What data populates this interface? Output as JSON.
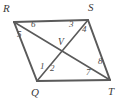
{
  "figure": {
    "type": "geometry-diagram",
    "shape": "parallelogram",
    "background_color": "#ffffff",
    "stroke_color": "#5a5a5a",
    "label_color": "#3a3a3a",
    "width": 123,
    "height": 105
  },
  "vertices": [
    {
      "id": "R",
      "label": "R",
      "x": 14,
      "y": 22,
      "label_x": 3,
      "label_y": 3
    },
    {
      "id": "S",
      "label": "S",
      "x": 88,
      "y": 20,
      "label_x": 88,
      "label_y": 2
    },
    {
      "id": "T",
      "label": "T",
      "x": 110,
      "y": 80,
      "label_x": 108,
      "label_y": 86
    },
    {
      "id": "Q",
      "label": "Q",
      "x": 37,
      "y": 81,
      "label_x": 31,
      "label_y": 87
    },
    {
      "id": "V",
      "label": "V",
      "x": 64,
      "y": 50,
      "label_x": 58,
      "label_y": 38
    }
  ],
  "edges": [
    {
      "name": "RS",
      "from": "R",
      "to": "S"
    },
    {
      "name": "ST",
      "from": "S",
      "to": "T"
    },
    {
      "name": "TQ",
      "from": "T",
      "to": "Q"
    },
    {
      "name": "QR",
      "from": "Q",
      "to": "R"
    }
  ],
  "diagonals": [
    {
      "name": "RT",
      "from": "R",
      "to": "T"
    },
    {
      "name": "QS",
      "from": "Q",
      "to": "S"
    }
  ],
  "angles": [
    {
      "number": "1",
      "at_vertex": "Q",
      "x": 40,
      "y": 62
    },
    {
      "number": "2",
      "at_vertex": "Q",
      "x": 50,
      "y": 64
    },
    {
      "number": "3",
      "at_vertex": "S",
      "x": 69,
      "y": 20
    },
    {
      "number": "4",
      "at_vertex": "S",
      "x": 82,
      "y": 25
    },
    {
      "number": "5",
      "at_vertex": "R",
      "x": 17,
      "y": 30
    },
    {
      "number": "6",
      "at_vertex": "R",
      "x": 31,
      "y": 20
    },
    {
      "number": "7",
      "at_vertex": "T",
      "x": 86,
      "y": 68
    },
    {
      "number": "8",
      "at_vertex": "T",
      "x": 98,
      "y": 57
    }
  ]
}
